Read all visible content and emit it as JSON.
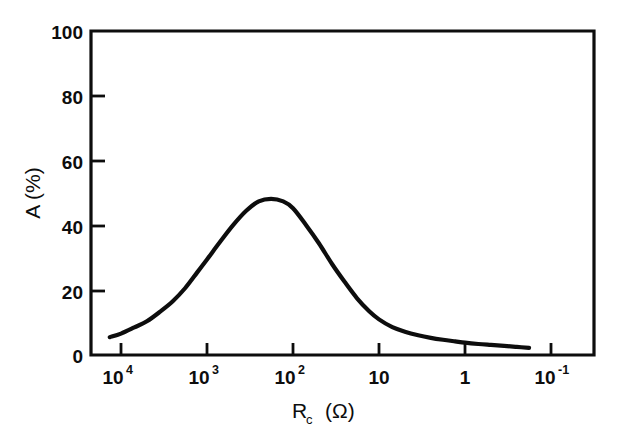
{
  "chart_data": {
    "type": "line",
    "title": "",
    "subtitle": "",
    "xlabel": "R_c  (Ω)",
    "xlabel_base": "R",
    "xlabel_sub": "c",
    "xlabel_unit": "(Ω)",
    "ylabel": "A (%)",
    "xscale": "log",
    "x_direction": "decreasing",
    "xlim": [
      31622.8,
      0.0316
    ],
    "ylim": [
      0,
      100
    ],
    "grid": false,
    "legend": null,
    "x_tick_labels": [
      "10⁴",
      "10³",
      "10²",
      "10",
      "1",
      "10⁻¹"
    ],
    "x_ticks": [
      {
        "mantissa": "10",
        "exponent": "4",
        "value": 10000
      },
      {
        "mantissa": "10",
        "exponent": "3",
        "value": 1000
      },
      {
        "mantissa": "10",
        "exponent": "2",
        "value": 100
      },
      {
        "mantissa": "10",
        "exponent": "",
        "value": 10
      },
      {
        "mantissa": "1",
        "exponent": "",
        "value": 1
      },
      {
        "mantissa": "10",
        "exponent": "-1",
        "value": 0.1
      }
    ],
    "y_ticks": [
      0,
      20,
      40,
      60,
      80,
      100
    ],
    "y_tick_labels": [
      "0",
      "20",
      "40",
      "60",
      "80",
      "100"
    ],
    "series": [
      {
        "name": "A",
        "color": "#0d0d0d",
        "x": [
          13500,
          10000,
          7000,
          5000,
          3500,
          2500,
          1800,
          1300,
          1000,
          700,
          500,
          350,
          250,
          180,
          130,
          100,
          70,
          50,
          35,
          25,
          18,
          13,
          10,
          7,
          5,
          3.5,
          2.5,
          1.8,
          1.3,
          1.0,
          0.7,
          0.5,
          0.35,
          0.25,
          0.18
        ],
        "y": [
          5.5,
          6.6,
          8.5,
          10.4,
          13.4,
          16.6,
          20.6,
          25.5,
          29.5,
          35.0,
          40.0,
          44.5,
          47.4,
          48.2,
          47.4,
          45.3,
          40.0,
          34.5,
          28.0,
          22.5,
          17.5,
          13.5,
          11.0,
          8.6,
          7.2,
          6.1,
          5.3,
          4.7,
          4.2,
          3.8,
          3.4,
          3.1,
          2.8,
          2.5,
          2.2
        ]
      }
    ],
    "peak": {
      "x": 300,
      "y": 48.2
    }
  },
  "colors": {
    "ink": "#0d0d0d",
    "background": "#ffffff"
  }
}
